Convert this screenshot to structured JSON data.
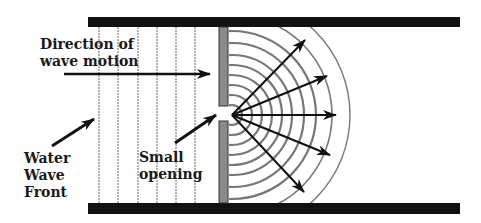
{
  "diagram": {
    "labels": {
      "direction_line1": "Direction of",
      "direction_line2": "wave motion",
      "front_line1": "Water",
      "front_line2": "Wave",
      "front_line3": "Front",
      "opening_line1": "Small",
      "opening_line2": "opening"
    },
    "colors": {
      "wall": "#111111",
      "barrier": "#8a8a8a",
      "wavefront": "#555555",
      "arc": "#777777",
      "arrow": "#111111"
    },
    "incoming_wavefront_x": [
      98,
      118,
      138,
      157,
      176,
      195
    ],
    "source": {
      "x": 232,
      "y": 115
    },
    "arc_radii": [
      10,
      20,
      30,
      40,
      50,
      60,
      72,
      84,
      100,
      118
    ],
    "ray_tips": [
      [
        305,
        40
      ],
      [
        327,
        76
      ],
      [
        336,
        115
      ],
      [
        330,
        155
      ],
      [
        304,
        192
      ]
    ]
  }
}
